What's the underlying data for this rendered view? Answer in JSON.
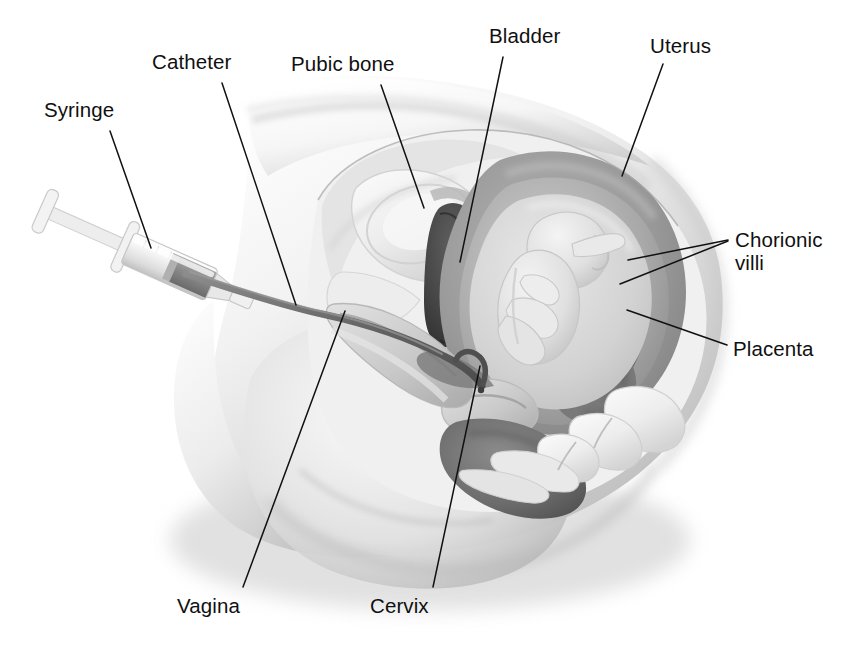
{
  "diagram": {
    "style": "grayscale medical illustration",
    "background_color": "#ffffff",
    "line_color": "#111111",
    "text_color": "#101010"
  },
  "labels": [
    {
      "id": "syringe",
      "text": "Syringe",
      "x": 44,
      "y": 98,
      "align": "left"
    },
    {
      "id": "catheter",
      "text": "Catheter",
      "x": 152,
      "y": 50,
      "align": "left"
    },
    {
      "id": "pubic-bone",
      "text": "Pubic bone",
      "x": 291,
      "y": 52,
      "align": "left"
    },
    {
      "id": "bladder",
      "text": "Bladder",
      "x": 489,
      "y": 24,
      "align": "left"
    },
    {
      "id": "uterus",
      "text": "Uterus",
      "x": 650,
      "y": 34,
      "align": "left"
    },
    {
      "id": "chorionic-villi",
      "text": "Chorionic\nvilli",
      "x": 735,
      "y": 228,
      "align": "left"
    },
    {
      "id": "placenta",
      "text": "Placenta",
      "x": 733,
      "y": 337,
      "align": "left"
    },
    {
      "id": "vagina",
      "text": "Vagina",
      "x": 177,
      "y": 594,
      "align": "left"
    },
    {
      "id": "cervix",
      "text": "Cervix",
      "x": 370,
      "y": 594,
      "align": "left"
    }
  ],
  "leader_lines": [
    {
      "id": "syringe-leader",
      "from": [
        110,
        131
      ],
      "to": [
        151,
        248
      ]
    },
    {
      "id": "catheter-leader",
      "from": [
        222,
        83
      ],
      "to": [
        296,
        305
      ]
    },
    {
      "id": "pubic-bone-leader",
      "from": [
        381,
        85
      ],
      "to": [
        424,
        208
      ]
    },
    {
      "id": "bladder-leader",
      "from": [
        503,
        57
      ],
      "to": [
        460,
        260
      ]
    },
    {
      "id": "uterus-leader",
      "from": [
        663,
        64
      ],
      "to": [
        622,
        176
      ]
    },
    {
      "id": "chorionic-villi-1",
      "from": [
        728,
        240
      ],
      "to": [
        628,
        260
      ]
    },
    {
      "id": "chorionic-villi-2",
      "from": [
        728,
        241
      ],
      "to": [
        620,
        283
      ]
    },
    {
      "id": "placenta-leader",
      "from": [
        727,
        345
      ],
      "to": [
        627,
        310
      ]
    },
    {
      "id": "vagina-leader",
      "from": [
        243,
        587
      ],
      "to": [
        345,
        311
      ]
    },
    {
      "id": "cervix-leader",
      "from": [
        433,
        587
      ],
      "to": [
        480,
        366
      ]
    }
  ],
  "anatomy": {
    "structures": [
      {
        "name": "maternal-body-silhouette",
        "tone": "#ffffff to #c8c8c8 gradient"
      },
      {
        "name": "abdominal-wall",
        "tone": "#e8e8e8"
      },
      {
        "name": "pubic-bone",
        "tone": "#efefef"
      },
      {
        "name": "bladder",
        "tone": "#4a4a4a"
      },
      {
        "name": "uterine-wall",
        "tone": "#9a9a9a"
      },
      {
        "name": "chorion-layer",
        "tone": "#8a8a8a"
      },
      {
        "name": "amniotic-cavity",
        "tone": "#d8d8d8"
      },
      {
        "name": "fetus",
        "tone": "#e6e6e6"
      },
      {
        "name": "placenta",
        "tone": "#707070"
      },
      {
        "name": "chorionic-villi",
        "tone": "#6e6e6e"
      },
      {
        "name": "cervix",
        "tone": "#c6c6c6"
      },
      {
        "name": "vagina",
        "tone": "#b5b5b5"
      },
      {
        "name": "rectum",
        "tone": "#6f6f6f"
      },
      {
        "name": "sacrum-vertebrae",
        "tone": "#ececec"
      },
      {
        "name": "coccyx",
        "tone": "#e4e4e4"
      },
      {
        "name": "catheter-tube",
        "tone": "#6a6a6a"
      },
      {
        "name": "syringe-barrel",
        "tone": "#f2f2f2"
      },
      {
        "name": "syringe-fluid",
        "tone": "#8c8c8c"
      }
    ]
  }
}
